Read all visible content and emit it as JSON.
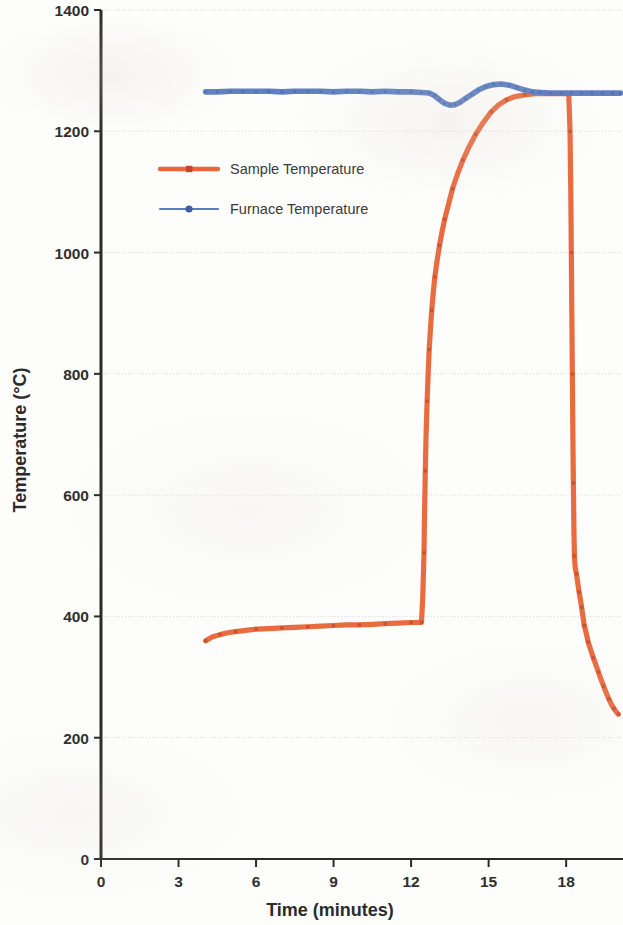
{
  "chart_data": {
    "type": "line",
    "title": "",
    "xlabel": "Time (minutes)",
    "ylabel": "Temperature (°C)",
    "xlim": [
      0,
      20.2
    ],
    "ylim": [
      0,
      1400
    ],
    "xticks": [
      0,
      3,
      6,
      9,
      12,
      15,
      18
    ],
    "yticks": [
      0,
      200,
      400,
      600,
      800,
      1000,
      1200,
      1400
    ],
    "xtick_labels": [
      "0",
      "3",
      "6",
      "9",
      "12",
      "15",
      "18"
    ],
    "ytick_labels": [
      "0",
      "200",
      "400",
      "600",
      "800",
      "1000",
      "1200",
      "1400"
    ],
    "grid": "horizontal",
    "legend_position": "inside-upper-left",
    "series": [
      {
        "name": "Sample Temperature",
        "color": "#E8663A",
        "marker": "square",
        "points": [
          [
            4.05,
            360
          ],
          [
            4.3,
            366
          ],
          [
            4.6,
            370
          ],
          [
            4.9,
            373
          ],
          [
            5.2,
            375
          ],
          [
            5.6,
            377
          ],
          [
            6.0,
            379
          ],
          [
            6.5,
            380
          ],
          [
            7.0,
            381
          ],
          [
            7.5,
            382
          ],
          [
            8.0,
            383
          ],
          [
            8.5,
            384
          ],
          [
            9.0,
            385
          ],
          [
            9.5,
            386
          ],
          [
            10.0,
            386
          ],
          [
            10.5,
            387
          ],
          [
            11.0,
            388
          ],
          [
            11.5,
            389
          ],
          [
            12.0,
            390
          ],
          [
            12.25,
            390
          ],
          [
            12.4,
            390
          ],
          [
            12.45,
            430
          ],
          [
            12.5,
            505
          ],
          [
            12.52,
            570
          ],
          [
            12.55,
            640
          ],
          [
            12.58,
            700
          ],
          [
            12.62,
            755
          ],
          [
            12.66,
            800
          ],
          [
            12.7,
            840
          ],
          [
            12.75,
            875
          ],
          [
            12.8,
            905
          ],
          [
            12.86,
            935
          ],
          [
            12.92,
            960
          ],
          [
            13.0,
            985
          ],
          [
            13.1,
            1012
          ],
          [
            13.2,
            1035
          ],
          [
            13.3,
            1055
          ],
          [
            13.45,
            1080
          ],
          [
            13.6,
            1105
          ],
          [
            13.8,
            1130
          ],
          [
            14.0,
            1152
          ],
          [
            14.25,
            1175
          ],
          [
            14.5,
            1195
          ],
          [
            14.8,
            1215
          ],
          [
            15.1,
            1232
          ],
          [
            15.4,
            1244
          ],
          [
            15.7,
            1252
          ],
          [
            16.0,
            1257
          ],
          [
            16.4,
            1260
          ],
          [
            16.8,
            1262
          ],
          [
            17.2,
            1262
          ],
          [
            17.6,
            1262
          ],
          [
            17.95,
            1262
          ],
          [
            18.1,
            1262
          ],
          [
            18.15,
            1200
          ],
          [
            18.18,
            1100
          ],
          [
            18.2,
            1000
          ],
          [
            18.22,
            900
          ],
          [
            18.24,
            800
          ],
          [
            18.26,
            700
          ],
          [
            18.28,
            620
          ],
          [
            18.3,
            545
          ],
          [
            18.32,
            500
          ],
          [
            18.35,
            480
          ],
          [
            18.4,
            470
          ],
          [
            18.45,
            455
          ],
          [
            18.5,
            440
          ],
          [
            18.55,
            428
          ],
          [
            18.6,
            415
          ],
          [
            18.65,
            400
          ],
          [
            18.7,
            385
          ],
          [
            18.78,
            372
          ],
          [
            18.85,
            358
          ],
          [
            18.95,
            345
          ],
          [
            19.05,
            332
          ],
          [
            19.15,
            320
          ],
          [
            19.25,
            308
          ],
          [
            19.35,
            296
          ],
          [
            19.45,
            285
          ],
          [
            19.55,
            274
          ],
          [
            19.65,
            264
          ],
          [
            19.75,
            255
          ],
          [
            19.85,
            248
          ],
          [
            19.95,
            242
          ],
          [
            20.02,
            239
          ]
        ]
      },
      {
        "name": "Furnace Temperature",
        "color": "#5B7CC0",
        "marker": "circle",
        "points": [
          [
            4.05,
            1265
          ],
          [
            4.5,
            1265
          ],
          [
            5.0,
            1266
          ],
          [
            5.5,
            1266
          ],
          [
            6.0,
            1266
          ],
          [
            6.5,
            1266
          ],
          [
            7.0,
            1265
          ],
          [
            7.5,
            1266
          ],
          [
            8.0,
            1266
          ],
          [
            8.5,
            1266
          ],
          [
            9.0,
            1265
          ],
          [
            9.5,
            1266
          ],
          [
            10.0,
            1266
          ],
          [
            10.5,
            1265
          ],
          [
            11.0,
            1266
          ],
          [
            11.5,
            1265
          ],
          [
            12.0,
            1265
          ],
          [
            12.4,
            1264
          ],
          [
            12.7,
            1263
          ],
          [
            12.9,
            1259
          ],
          [
            13.1,
            1252
          ],
          [
            13.3,
            1246
          ],
          [
            13.5,
            1243
          ],
          [
            13.7,
            1244
          ],
          [
            13.9,
            1248
          ],
          [
            14.1,
            1254
          ],
          [
            14.35,
            1261
          ],
          [
            14.6,
            1268
          ],
          [
            14.9,
            1274
          ],
          [
            15.2,
            1277
          ],
          [
            15.5,
            1278
          ],
          [
            15.8,
            1276
          ],
          [
            16.1,
            1272
          ],
          [
            16.4,
            1268
          ],
          [
            16.7,
            1265
          ],
          [
            17.0,
            1264
          ],
          [
            17.4,
            1263
          ],
          [
            17.8,
            1263
          ],
          [
            18.2,
            1263
          ],
          [
            18.6,
            1263
          ],
          [
            19.0,
            1263
          ],
          [
            19.4,
            1263
          ],
          [
            19.8,
            1263
          ],
          [
            20.1,
            1263
          ]
        ]
      }
    ],
    "legend_entries": [
      {
        "label": "Sample Temperature",
        "color": "#E8663A",
        "marker": "square"
      },
      {
        "label": "Furnace Temperature",
        "color": "#5B7CC0",
        "marker": "circle"
      }
    ]
  },
  "colors": {
    "sample": "#E8663A",
    "furnace": "#5B7CC0",
    "axis": "#2b2b2b",
    "grid": "#d8d8d8",
    "background": "#fdfdfb"
  }
}
